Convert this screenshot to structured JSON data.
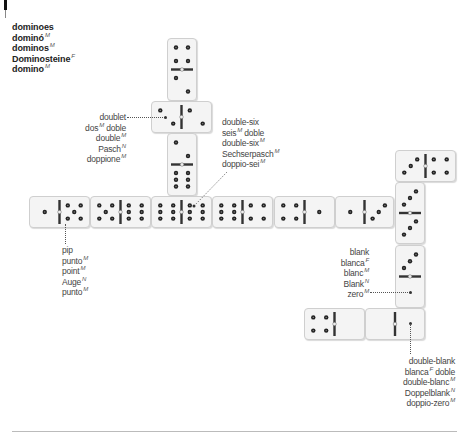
{
  "title": {
    "terms": [
      {
        "text": "dominoes",
        "gender": ""
      },
      {
        "text": "dominó",
        "gender": "M"
      },
      {
        "text": "dominos",
        "gender": "M"
      },
      {
        "text": "Dominosteine",
        "gender": "F"
      },
      {
        "text": "domino",
        "gender": "M"
      }
    ]
  },
  "labels": {
    "doublet": {
      "terms": [
        {
          "text": "doublet",
          "gender": ""
        },
        {
          "text": "dos",
          "gender": "M",
          "suffix": " doble"
        },
        {
          "text": "double",
          "gender": "M"
        },
        {
          "text": "Pasch",
          "gender": "N"
        },
        {
          "text": "doppione",
          "gender": "M"
        }
      ]
    },
    "double_six": {
      "terms": [
        {
          "text": "double-six",
          "gender": ""
        },
        {
          "text": "seis",
          "gender": "M",
          "suffix": " doble"
        },
        {
          "text": "double-six",
          "gender": "M"
        },
        {
          "text": "Sechserpasch",
          "gender": "M"
        },
        {
          "text": "doppio-sei",
          "gender": "M"
        }
      ]
    },
    "pip": {
      "terms": [
        {
          "text": "pip",
          "gender": ""
        },
        {
          "text": "punto",
          "gender": "M"
        },
        {
          "text": "point",
          "gender": "M"
        },
        {
          "text": "Auge",
          "gender": "N"
        },
        {
          "text": "punto",
          "gender": "M"
        }
      ]
    },
    "blank": {
      "terms": [
        {
          "text": "blank",
          "gender": ""
        },
        {
          "text": "blanca",
          "gender": "F"
        },
        {
          "text": "blanc",
          "gender": "M"
        },
        {
          "text": "Blank",
          "gender": "N"
        },
        {
          "text": "zero",
          "gender": "M"
        }
      ]
    },
    "double_blank": {
      "terms": [
        {
          "text": "double-blank",
          "gender": ""
        },
        {
          "text": "blanca",
          "gender": "F",
          "suffix": " doble"
        },
        {
          "text": "double-blanc",
          "gender": "M"
        },
        {
          "text": "Doppelblank",
          "gender": "N"
        },
        {
          "text": "doppio-zero",
          "gender": "M"
        }
      ]
    }
  },
  "dominoes": [
    {
      "id": "top-vertical",
      "orientation": "vertical",
      "values": [
        4,
        2
      ]
    },
    {
      "id": "doublet",
      "orientation": "horizontal",
      "values": [
        2,
        2
      ]
    },
    {
      "id": "mid-vertical",
      "orientation": "vertical",
      "values": [
        2,
        6
      ]
    },
    {
      "id": "row-1",
      "orientation": "horizontal",
      "values": [
        1,
        5
      ]
    },
    {
      "id": "row-2",
      "orientation": "horizontal",
      "values": [
        5,
        6
      ]
    },
    {
      "id": "double-six",
      "orientation": "horizontal",
      "values": [
        6,
        6
      ]
    },
    {
      "id": "row-4",
      "orientation": "horizontal",
      "values": [
        6,
        4
      ]
    },
    {
      "id": "row-5",
      "orientation": "horizontal",
      "values": [
        4,
        1
      ]
    },
    {
      "id": "row-6",
      "orientation": "horizontal",
      "values": [
        1,
        3
      ]
    },
    {
      "id": "right-top",
      "orientation": "horizontal",
      "values": [
        3,
        4
      ]
    },
    {
      "id": "right-vertical-1",
      "orientation": "vertical",
      "values": [
        3,
        3
      ]
    },
    {
      "id": "right-vertical-2",
      "orientation": "vertical",
      "values": [
        3,
        0
      ]
    },
    {
      "id": "bottom-1",
      "orientation": "horizontal",
      "values": [
        4,
        0
      ]
    },
    {
      "id": "double-blank",
      "orientation": "horizontal",
      "values": [
        0,
        0
      ]
    }
  ]
}
